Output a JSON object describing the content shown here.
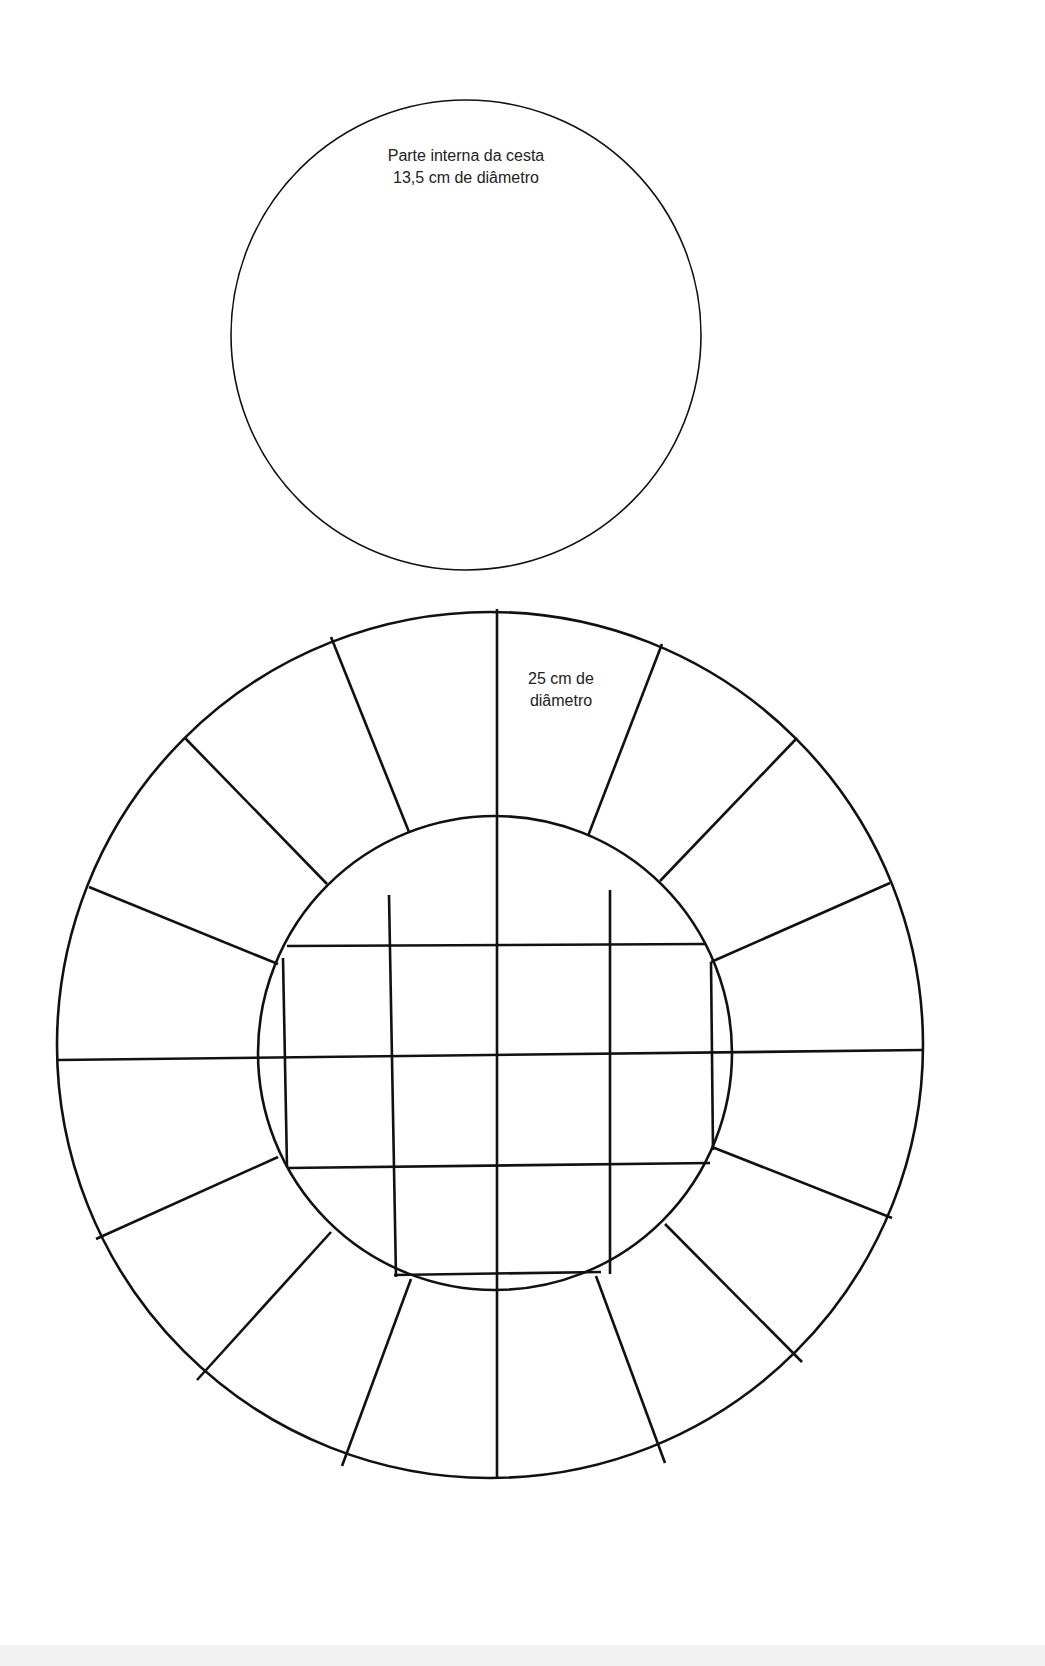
{
  "diagram": {
    "type": "craft-template",
    "background": "#ffffff",
    "line_color": "#111111",
    "top_circle": {
      "label_line1": "Parte interna da cesta",
      "label_line2": "13,5 cm de diâmetro",
      "cx": 466,
      "cy": 335,
      "r": 235,
      "stroke_width": 1.5
    },
    "bottom_template": {
      "label_line1": "25 cm de",
      "label_line2": "diâmetro",
      "outer": {
        "cx": 490,
        "cy": 1045,
        "r": 433,
        "stroke_width": 2.5
      },
      "inner": {
        "cx": 495,
        "cy": 1053,
        "r": 237,
        "stroke_width": 2.5
      },
      "radial_segments": 16,
      "grid": {
        "vertical_lines_x": [
          390,
          497,
          610
        ],
        "horizontal_lines_y": [
          945,
          1053,
          1167
        ]
      }
    }
  }
}
